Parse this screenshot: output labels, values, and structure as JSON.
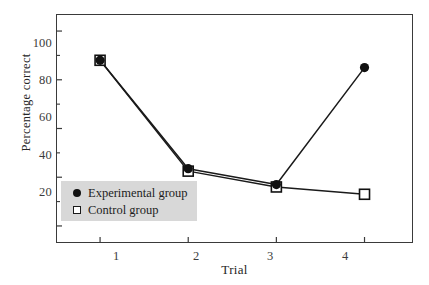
{
  "chart_data": {
    "type": "line",
    "title": "",
    "subtitle": "",
    "xlabel": "Trial",
    "ylabel": "Percentage correct",
    "x": [
      1,
      2,
      3,
      4
    ],
    "categories": [
      "1",
      "2",
      "3",
      "4"
    ],
    "xlim": [
      0.5,
      4.55
    ],
    "ylim": [
      13,
      107
    ],
    "xticks": [
      1,
      2,
      3,
      4
    ],
    "xtick_labels": [
      "1",
      "2",
      "3",
      "4"
    ],
    "yticks": [
      20,
      40,
      60,
      80,
      100
    ],
    "ytick_labels": [
      "20",
      "40",
      "60",
      "80",
      "100"
    ],
    "yticks_minor": [
      30,
      50,
      70,
      90
    ],
    "grid": false,
    "legend_position": "lower left",
    "series": [
      {
        "name": "Experimental group",
        "marker": "filled-circle",
        "color": "#111111",
        "values": [
          88,
          43.5,
          37,
          85
        ]
      },
      {
        "name": "Control group",
        "marker": "open-square",
        "color": "#111111",
        "values": [
          88,
          42.5,
          36,
          33
        ]
      }
    ]
  },
  "axes": {
    "y_title": "Percentage correct",
    "x_title": "Trial",
    "y_tick_labels": [
      "100",
      "80",
      "60",
      "40",
      "20"
    ],
    "x_tick_labels": [
      "1",
      "2",
      "3",
      "4"
    ]
  },
  "legend": {
    "background_color": "#d8d8d8",
    "items": [
      {
        "label": "Experimental group",
        "marker": "filled-circle-icon"
      },
      {
        "label": "Control group",
        "marker": "open-square-icon"
      }
    ]
  },
  "colors": {
    "line": "#1a1a1a",
    "frame": "#3a3a3a",
    "marker_fill": "#111111",
    "marker_open_fill": "#ffffff",
    "background": "#ffffff",
    "text": "#262626"
  }
}
